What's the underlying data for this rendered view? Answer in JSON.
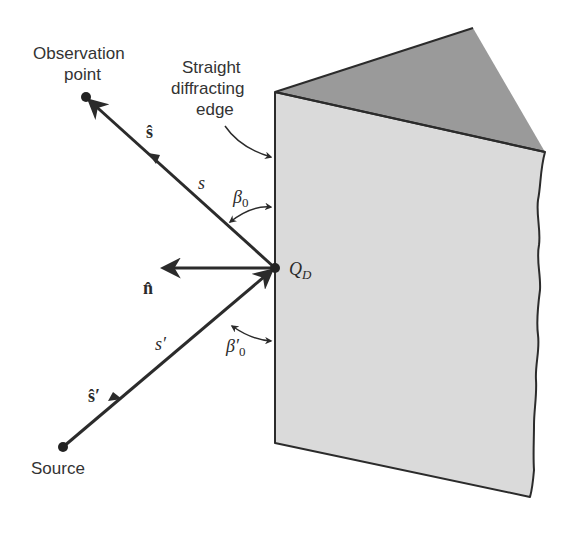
{
  "figure": {
    "labels": {
      "observation_point_line1": "Observation",
      "observation_point_line2": "point",
      "edge_line1": "Straight",
      "edge_line2": "diffracting",
      "edge_line3": "edge",
      "source": "Source",
      "s_hat": "ŝ",
      "s": "s",
      "beta0_symbol": "β",
      "beta0_sub": "0",
      "n_hat": "n̂",
      "QD_symbol": "Q",
      "QD_sub": "D",
      "s_prime": "s′",
      "s_hat_prime": "ŝ′",
      "beta0_prime_symbol": "β′",
      "beta0_prime_sub": "0"
    },
    "colors": {
      "background": "#ffffff",
      "front_face": "#dadada",
      "top_face": "#9a9a9a",
      "stroke": "#2b2b2b",
      "text": "#333333"
    },
    "points": {
      "observation_point": [
        86,
        97
      ],
      "source_point": [
        63,
        447
      ],
      "diffraction_point_QD": [
        275,
        268
      ],
      "edge_top": [
        275,
        92
      ],
      "edge_bottom": [
        275,
        443
      ],
      "top_apex": [
        473,
        28
      ],
      "top_right": [
        545,
        152
      ],
      "bottom_right": [
        530,
        497
      ]
    }
  }
}
